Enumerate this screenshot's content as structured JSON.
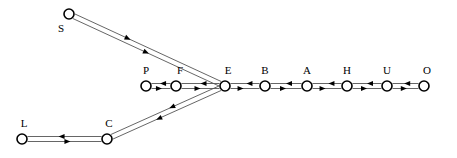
{
  "diagram": {
    "background_color": "#ffffff",
    "node_stroke_color": "#000000",
    "node_fill_color": "#ffffff",
    "edge_color": "#555555",
    "arrow_color": "#000000",
    "label_color": "#000000",
    "node_radius": 5,
    "edge_gap": 5,
    "nodes": [
      {
        "id": "S",
        "label": "S",
        "x": 69,
        "y": 14,
        "label_x": 61,
        "label_y": 32
      },
      {
        "id": "P",
        "label": "P",
        "x": 146,
        "y": 86,
        "label_x": 146,
        "label_y": 74
      },
      {
        "id": "F",
        "label": "F",
        "x": 176,
        "y": 86,
        "label_x": 180,
        "label_y": 74
      },
      {
        "id": "E",
        "label": "E",
        "x": 225,
        "y": 86,
        "label_x": 228,
        "label_y": 74
      },
      {
        "id": "B",
        "label": "B",
        "x": 265,
        "y": 86,
        "label_x": 265,
        "label_y": 74
      },
      {
        "id": "A",
        "label": "A",
        "x": 307,
        "y": 86,
        "label_x": 307,
        "label_y": 74
      },
      {
        "id": "H",
        "label": "H",
        "x": 347,
        "y": 86,
        "label_x": 347,
        "label_y": 74
      },
      {
        "id": "U",
        "label": "U",
        "x": 387,
        "y": 86,
        "label_x": 387,
        "label_y": 74
      },
      {
        "id": "O",
        "label": "O",
        "x": 424,
        "y": 86,
        "label_x": 427,
        "label_y": 74
      },
      {
        "id": "L",
        "label": "L",
        "x": 22,
        "y": 139,
        "label_x": 24,
        "label_y": 127
      },
      {
        "id": "C",
        "label": "C",
        "x": 107,
        "y": 139,
        "label_x": 109,
        "label_y": 127
      }
    ],
    "edges": [
      {
        "id": "S-E",
        "from": "S",
        "to": "E",
        "bidirectional": true,
        "arrow_fraction_forward": 0.52,
        "arrow_fraction_back": 0.62
      },
      {
        "id": "P-F",
        "from": "P",
        "to": "F",
        "bidirectional": true,
        "arrow_fraction_forward": 0.55,
        "arrow_fraction_back": 0.55
      },
      {
        "id": "F-E",
        "from": "F",
        "to": "E",
        "bidirectional": true,
        "arrow_fraction_forward": 0.5,
        "arrow_fraction_back": 0.5
      },
      {
        "id": "E-B",
        "from": "E",
        "to": "B",
        "bidirectional": true,
        "arrow_fraction_forward": 0.45,
        "arrow_fraction_back": 0.45
      },
      {
        "id": "B-A",
        "from": "B",
        "to": "A",
        "bidirectional": true,
        "arrow_fraction_forward": 0.5,
        "arrow_fraction_back": 0.5
      },
      {
        "id": "A-H",
        "from": "A",
        "to": "H",
        "bidirectional": true,
        "arrow_fraction_forward": 0.45,
        "arrow_fraction_back": 0.45
      },
      {
        "id": "H-U",
        "from": "H",
        "to": "U",
        "bidirectional": true,
        "arrow_fraction_forward": 0.5,
        "arrow_fraction_back": 0.5
      },
      {
        "id": "U-O",
        "from": "U",
        "to": "O",
        "bidirectional": true,
        "arrow_fraction_forward": 0.55,
        "arrow_fraction_back": 0.55
      },
      {
        "id": "L-C",
        "from": "L",
        "to": "C",
        "bidirectional": true,
        "arrow_fraction_forward": 0.58,
        "arrow_fraction_back": 0.58
      },
      {
        "id": "C-E",
        "from": "C",
        "to": "E",
        "bidirectional": true,
        "arrow_fraction_forward": 0.4,
        "arrow_fraction_back": 0.46
      }
    ]
  }
}
